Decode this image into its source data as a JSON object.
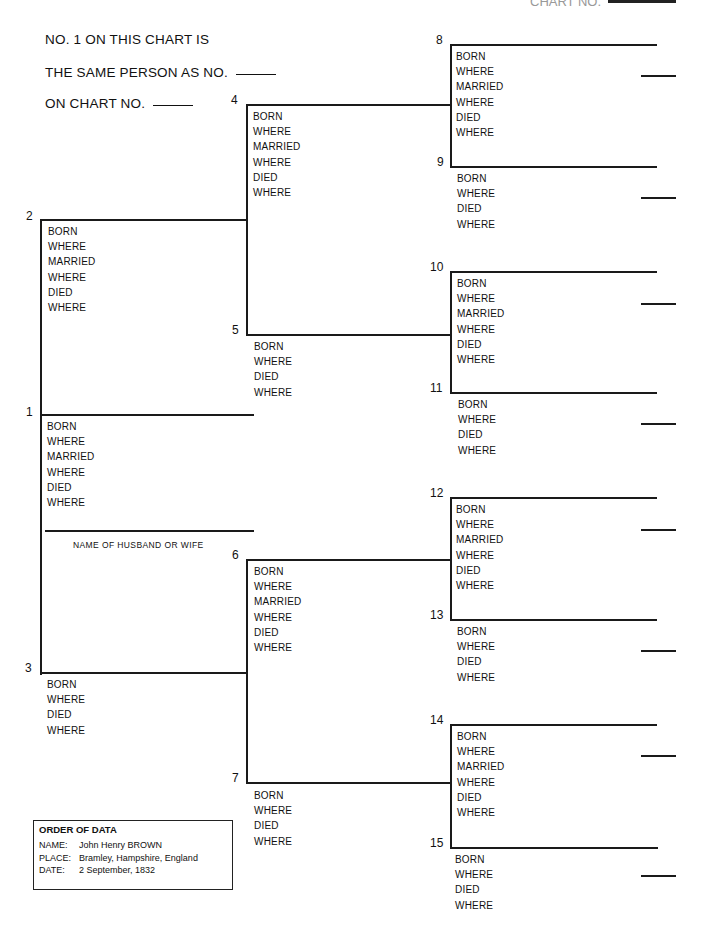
{
  "header": {
    "chart_no_label": "CHART NO.",
    "line1": "NO. 1 ON THIS CHART IS",
    "line2": "THE SAME PERSON AS NO.",
    "line3": "ON CHART NO."
  },
  "field_labels": {
    "born": "BORN",
    "where": "WHERE",
    "married": "MARRIED",
    "died": "DIED"
  },
  "persons": [
    {
      "no": "1",
      "fields": [
        "BORN",
        "WHERE",
        "MARRIED",
        "WHERE",
        "DIED",
        "WHERE"
      ]
    },
    {
      "no": "2",
      "fields": [
        "BORN",
        "WHERE",
        "MARRIED",
        "WHERE",
        "DIED",
        "WHERE"
      ]
    },
    {
      "no": "3",
      "fields": [
        "BORN",
        "WHERE",
        "DIED",
        "WHERE"
      ]
    },
    {
      "no": "4",
      "fields": [
        "BORN",
        "WHERE",
        "MARRIED",
        "WHERE",
        "DIED",
        "WHERE"
      ]
    },
    {
      "no": "5",
      "fields": [
        "BORN",
        "WHERE",
        "DIED",
        "WHERE"
      ]
    },
    {
      "no": "6",
      "fields": [
        "BORN",
        "WHERE",
        "MARRIED",
        "WHERE",
        "DIED",
        "WHERE"
      ]
    },
    {
      "no": "7",
      "fields": [
        "BORN",
        "WHERE",
        "DIED",
        "WHERE"
      ]
    },
    {
      "no": "8",
      "fields": [
        "BORN",
        "WHERE",
        "MARRIED",
        "WHERE",
        "DIED",
        "WHERE"
      ]
    },
    {
      "no": "9",
      "fields": [
        "BORN",
        "WHERE",
        "DIED",
        "WHERE"
      ]
    },
    {
      "no": "10",
      "fields": [
        "BORN",
        "WHERE",
        "MARRIED",
        "WHERE",
        "DIED",
        "WHERE"
      ]
    },
    {
      "no": "11",
      "fields": [
        "BORN",
        "WHERE",
        "DIED",
        "WHERE"
      ]
    },
    {
      "no": "12",
      "fields": [
        "BORN",
        "WHERE",
        "MARRIED",
        "WHERE",
        "DIED",
        "WHERE"
      ]
    },
    {
      "no": "13",
      "fields": [
        "BORN",
        "WHERE",
        "DIED",
        "WHERE"
      ]
    },
    {
      "no": "14",
      "fields": [
        "BORN",
        "WHERE",
        "MARRIED",
        "WHERE",
        "DIED",
        "WHERE"
      ]
    },
    {
      "no": "15",
      "fields": [
        "BORN",
        "WHERE",
        "DIED",
        "WHERE"
      ]
    }
  ],
  "spouse_label": "NAME OF HUSBAND OR WIFE",
  "order_of_data": {
    "title": "ORDER OF DATA",
    "rows": [
      {
        "key": "NAME:",
        "value": "John Henry BROWN"
      },
      {
        "key": "PLACE:",
        "value": "Bramley, Hampshire, England"
      },
      {
        "key": "DATE:",
        "value": "2 September, 1832"
      }
    ]
  }
}
